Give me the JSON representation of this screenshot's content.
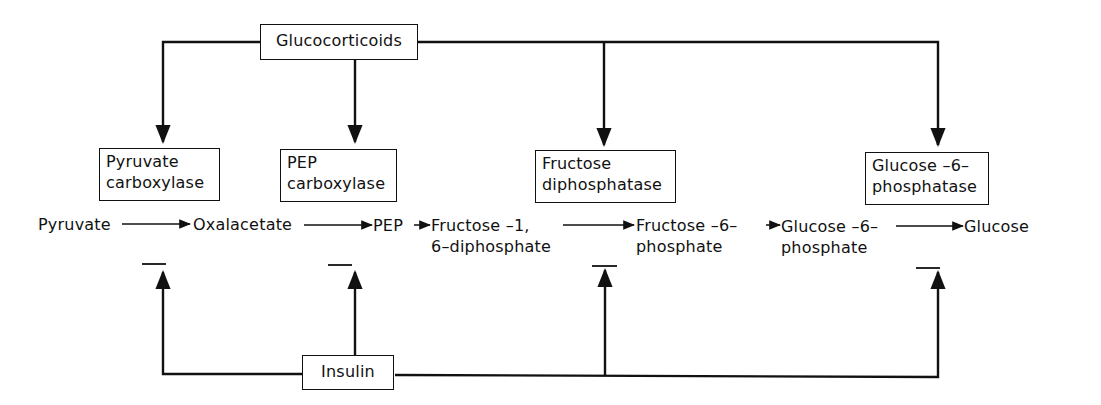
{
  "diagram": {
    "type": "regulation-pathway",
    "regulators": {
      "activator": "Glucocorticoids",
      "inhibitor": "Insulin"
    },
    "enzymes": [
      {
        "line1": "Pyruvate",
        "line2": "carboxylase"
      },
      {
        "line1": "PEP",
        "line2": "carboxylase"
      },
      {
        "line1": "Fructose",
        "line2": "diphosphatase"
      },
      {
        "line1": "Glucose –6–",
        "line2": "phosphatase"
      }
    ],
    "metabolites": [
      {
        "line1": "Pyruvate",
        "line2": ""
      },
      {
        "line1": "Oxalacetate",
        "line2": ""
      },
      {
        "line1": "PEP",
        "line2": ""
      },
      {
        "line1": "Fructose –1,",
        "line2": "6–diphosphate"
      },
      {
        "line1": "Fructose –6–",
        "line2": "phosphate"
      },
      {
        "line1": "Glucose –6–",
        "line2": "phosphate"
      },
      {
        "line1": "Glucose",
        "line2": ""
      }
    ],
    "edges": [
      {
        "from": "Glucocorticoids",
        "to": "Pyruvate carboxylase",
        "type": "induces"
      },
      {
        "from": "Glucocorticoids",
        "to": "PEP carboxylase",
        "type": "induces"
      },
      {
        "from": "Glucocorticoids",
        "to": "Fructose diphosphatase",
        "type": "induces"
      },
      {
        "from": "Glucocorticoids",
        "to": "Glucose-6-phosphatase",
        "type": "induces"
      },
      {
        "from": "Insulin",
        "to": "Pyruvate carboxylase",
        "type": "inhibits"
      },
      {
        "from": "Insulin",
        "to": "PEP carboxylase",
        "type": "inhibits"
      },
      {
        "from": "Insulin",
        "to": "Fructose diphosphatase",
        "type": "inhibits"
      },
      {
        "from": "Insulin",
        "to": "Glucose-6-phosphatase",
        "type": "inhibits"
      }
    ]
  }
}
